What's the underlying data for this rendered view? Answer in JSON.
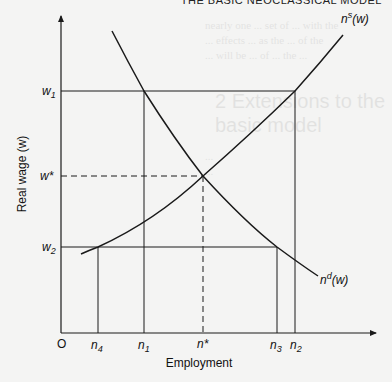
{
  "page_header": "THE BASIC NEOCLASSICAL MODEL",
  "bleed_through": {
    "heading": "2 Extensions to the basic model",
    "lines": [
      "nearly one ... set of ... with the",
      "... effects ... as the ... of the",
      "... will be ... of ... the ...",
      "...",
      "..."
    ]
  },
  "diagram": {
    "y_axis_label": "Real wage (w)",
    "x_axis_label": "Employment",
    "origin_label": "O",
    "y_ticks": {
      "w1": "w",
      "w1_sub": "1",
      "wstar": "w*",
      "w2": "w",
      "w2_sub": "2"
    },
    "x_ticks": {
      "n4": "n",
      "n4_sub": "4",
      "n1": "n",
      "n1_sub": "1",
      "nstar": "n*",
      "n3": "n",
      "n3_sub": "3",
      "n2": "n",
      "n2_sub": "2"
    },
    "curves": {
      "supply_label": "n",
      "supply_sup": "s",
      "supply_arg": "(w)",
      "demand_label": "n",
      "demand_sup": "d",
      "demand_arg": "(w)"
    },
    "colors": {
      "line": "#1a1a1a",
      "background": "#f4f4f3"
    }
  }
}
